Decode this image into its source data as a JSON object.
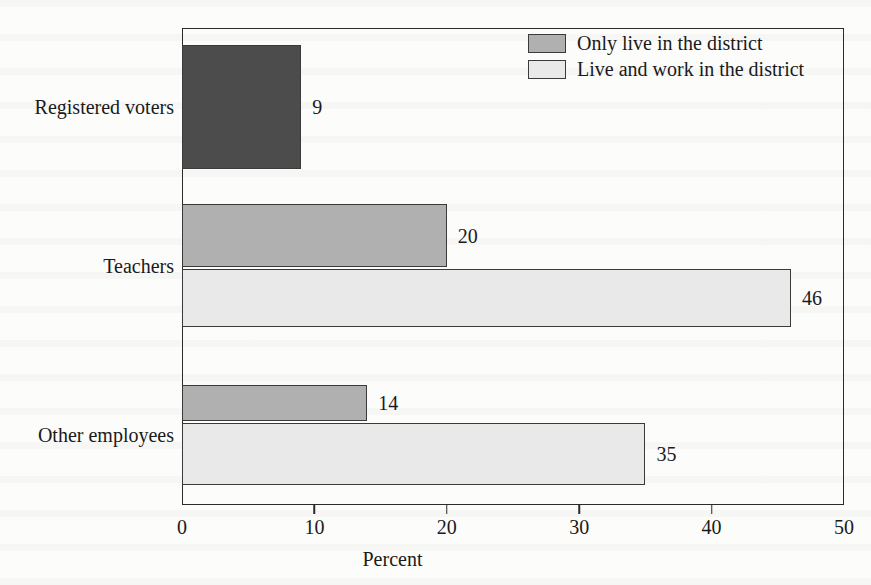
{
  "chart_data": {
    "type": "bar",
    "orientation": "horizontal",
    "title": "",
    "subtitle": "",
    "xlabel": "Percent",
    "ylabel": "",
    "xlim": [
      0,
      50
    ],
    "xticks": [
      0,
      10,
      20,
      30,
      40,
      50
    ],
    "xtick_labels": [
      "0",
      "10",
      "20",
      "30",
      "40",
      "50"
    ],
    "grid": false,
    "legend_position": "top-right",
    "categories": [
      "Registered voters",
      "Teachers",
      "Other employees"
    ],
    "series": [
      {
        "name": "Only live in the district",
        "color": "#b0b0b0",
        "values": [
          9,
          20,
          14
        ],
        "value_labels": [
          "9",
          "20",
          "14"
        ]
      },
      {
        "name": "Live and work in the district",
        "color": "#e9e9e9",
        "values": [
          null,
          46,
          35
        ],
        "value_labels": [
          "",
          "46",
          "35"
        ]
      }
    ],
    "bars": [
      {
        "category": "Registered voters",
        "series": "Only live in the district",
        "value": 9,
        "label": "9",
        "color": "#4c4c4c"
      },
      {
        "category": "Teachers",
        "series": "Only live in the district",
        "value": 20,
        "label": "20",
        "color": "#b0b0b0"
      },
      {
        "category": "Teachers",
        "series": "Live and work in the district",
        "value": 46,
        "label": "46",
        "color": "#e9e9e9"
      },
      {
        "category": "Other employees",
        "series": "Only live in the district",
        "value": 14,
        "label": "14",
        "color": "#b0b0b0"
      },
      {
        "category": "Other employees",
        "series": "Live and work in the district",
        "value": 35,
        "label": "35",
        "color": "#e9e9e9"
      }
    ]
  },
  "legend": {
    "items": [
      {
        "label": "Only live in the district",
        "swatch_color": "#b0b0b0"
      },
      {
        "label": "Live and work in the district",
        "swatch_color": "#e9e9e9"
      }
    ]
  },
  "axis": {
    "x_title": "Percent",
    "ticks": [
      "0",
      "10",
      "20",
      "30",
      "40",
      "50"
    ]
  },
  "categories": [
    {
      "label": "Registered voters"
    },
    {
      "label": "Teachers"
    },
    {
      "label": "Other employees"
    }
  ],
  "colors": {
    "bar_dark": "#4c4c4c",
    "bar_medium": "#b0b0b0",
    "bar_light": "#e9e9e9",
    "frame": "#2b2b2b",
    "text": "#1a1a1a",
    "page": "#fcfcfb"
  }
}
